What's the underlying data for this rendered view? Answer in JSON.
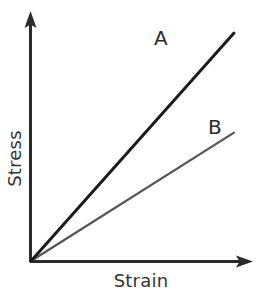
{
  "chart_data": {
    "type": "line",
    "title": "",
    "xlabel": "Strain",
    "ylabel": "Stress",
    "grid": false,
    "legend": "inline-end-labels",
    "xlim": [
      0,
      1
    ],
    "ylim": [
      0,
      1
    ],
    "axis_ticks": {
      "x": [],
      "y": []
    },
    "annotations": [
      {
        "text": "A",
        "series": "A",
        "position": "above-left-of-line-end"
      },
      {
        "text": "B",
        "series": "B",
        "position": "above-left-of-line-end"
      }
    ],
    "series": [
      {
        "name": "A",
        "label": "A",
        "color": "#1c1c1c",
        "width": 3,
        "description": "Steeper straight line through origin — higher Young's modulus",
        "x": [
          0,
          1
        ],
        "y": [
          0,
          1
        ],
        "slope": 1.0,
        "intercept": 0
      },
      {
        "name": "B",
        "label": "B",
        "color": "#555555",
        "width": 2.2,
        "description": "Shallower straight line through origin — lower Young's modulus",
        "x": [
          0,
          1
        ],
        "y": [
          0,
          0.563
        ],
        "slope": 0.563,
        "intercept": 0
      }
    ]
  },
  "axes": {
    "x_axis_name": "Strain",
    "y_axis_name": "Stress",
    "arrowheads": true,
    "color": "#2b2b2b"
  },
  "labels": {
    "series_a": "A",
    "series_b": "B",
    "x_title": "Strain",
    "y_title": "Stress"
  },
  "colors": {
    "background": "#ffffff",
    "axis": "#2b2b2b",
    "text": "#333333",
    "series_a": "#1c1c1c",
    "series_b": "#555555"
  }
}
